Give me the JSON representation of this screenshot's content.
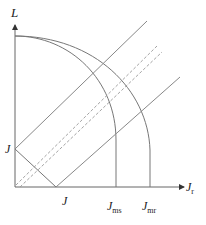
{
  "diagram": {
    "type": "current-limit-diagram",
    "axes": {
      "y_label": "L",
      "x_label": "J",
      "x_label_sub": "r"
    },
    "labels": {
      "j_y_intercept": "J",
      "j_x_intercept": "J",
      "j_ms": "J",
      "j_ms_sub": "ms",
      "j_mr": "J",
      "j_mr_sub": "mr"
    },
    "colors": {
      "axis": "#555555",
      "curve": "#777777",
      "line": "#888888",
      "dashed": "#999999"
    }
  }
}
